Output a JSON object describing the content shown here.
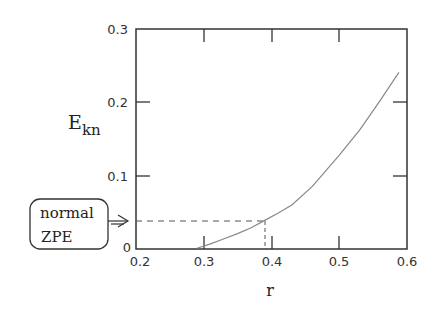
{
  "chart_data": {
    "type": "line",
    "title": "",
    "xlabel": "r",
    "ylabel": "E_kn",
    "ylabel_main": "E",
    "ylabel_sub": "kn",
    "xlim": [
      0.2,
      0.6
    ],
    "ylim": [
      0,
      0.3
    ],
    "x_ticks": [
      0.2,
      0.3,
      0.4,
      0.5,
      0.6
    ],
    "x_tick_labels": [
      "0.2",
      "0.3",
      "0.4",
      "0.5",
      "0.6"
    ],
    "y_ticks": [
      0,
      0.1,
      0.2,
      0.3
    ],
    "y_tick_labels": [
      "0",
      "0.1",
      "0.2",
      "0.3"
    ],
    "grid": false,
    "legend": null,
    "series": [
      {
        "name": "E_kn(r)",
        "color": "#888888",
        "x": [
          0.29,
          0.31,
          0.33,
          0.35,
          0.37,
          0.39,
          0.41,
          0.43,
          0.46,
          0.5,
          0.53,
          0.56,
          0.588
        ],
        "y": [
          0.001,
          0.007,
          0.014,
          0.021,
          0.029,
          0.039,
          0.049,
          0.06,
          0.085,
          0.128,
          0.162,
          0.202,
          0.241
        ]
      }
    ],
    "annotations": [
      {
        "type": "dashed-marker",
        "x": 0.39,
        "y": 0.039,
        "description": "horizontal dashed line from y-axis to curve, vertical dashed line down to x-axis"
      },
      {
        "type": "callout-box",
        "lines": [
          "normal",
          "ZPE"
        ],
        "points_to_y": 0.039
      }
    ]
  },
  "labels": {
    "x_axis": "r",
    "y_axis_main": "E",
    "y_axis_sub": "kn",
    "note_line1": "normal",
    "note_line2": "ZPE",
    "ytick_0": "0",
    "ytick_1": "0.1",
    "ytick_2": "0.2",
    "ytick_3": "0.3",
    "xtick_0": "0.2",
    "xtick_1": "0.3",
    "xtick_2": "0.4",
    "xtick_3": "0.5",
    "xtick_4": "0.6"
  },
  "colors": {
    "axis": "#333333",
    "curve": "#8a8a8a",
    "dashed": "#555555",
    "text": "#222222"
  }
}
